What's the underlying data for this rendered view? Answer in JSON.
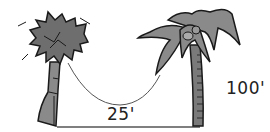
{
  "diagram": {
    "labels": {
      "distance": "25'",
      "height": "100'"
    },
    "colors": {
      "foliage_left": "#6e6e6e",
      "foliage_right": "#8a8a8a",
      "trunk": "#7a7a7a",
      "outline": "#1a1a1a",
      "rope": "#555555",
      "ground": "#555555",
      "background": "#ffffff"
    }
  }
}
